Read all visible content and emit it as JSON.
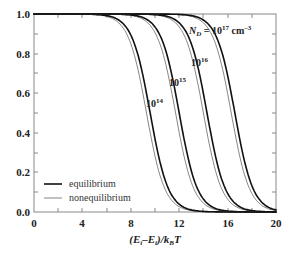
{
  "chart_data": {
    "type": "line",
    "title": "",
    "xlabel": "(E_t - E_i)/k_B T",
    "ylabel": "",
    "xlim": [
      0,
      20
    ],
    "ylim": [
      0.0,
      1.0
    ],
    "x_ticks": [
      "0",
      "4",
      "8",
      "12",
      "16",
      "20"
    ],
    "y_ticks": [
      "0.0",
      "0.2",
      "0.4",
      "0.6",
      "0.8",
      "1.0"
    ],
    "grid": false,
    "legend": {
      "position": "lower left",
      "entries": [
        {
          "label": "equilibrium",
          "style": "thick"
        },
        {
          "label": "nonequilibrium",
          "style": "thin"
        }
      ]
    },
    "annotations": [
      {
        "text": "N_D = 10^17 cm^-3",
        "applies_to": "10^17"
      },
      {
        "text": "10^16"
      },
      {
        "text": "10^15"
      },
      {
        "text": "10^14"
      }
    ],
    "series": [
      {
        "name": "equilibrium, N_D=1e14",
        "midpoint_x": 9.6,
        "width": 0.75
      },
      {
        "name": "nonequilibrium, N_D=1e14",
        "midpoint_x": 9.3,
        "width": 0.75
      },
      {
        "name": "equilibrium, N_D=1e15",
        "midpoint_x": 12.0,
        "width": 0.75
      },
      {
        "name": "nonequilibrium, N_D=1e15",
        "midpoint_x": 11.7,
        "width": 0.75
      },
      {
        "name": "equilibrium, N_D=1e16",
        "midpoint_x": 14.3,
        "width": 0.75
      },
      {
        "name": "nonequilibrium, N_D=1e16",
        "midpoint_x": 14.0,
        "width": 0.75
      },
      {
        "name": "equilibrium, N_D=1e17",
        "midpoint_x": 16.6,
        "width": 0.75
      },
      {
        "name": "nonequilibrium, N_D=1e17",
        "midpoint_x": 16.3,
        "width": 0.75
      }
    ],
    "sample_points": {
      "x": [
        0,
        4,
        6,
        8,
        9,
        10,
        11,
        12,
        13,
        14,
        15,
        16,
        17,
        18,
        19,
        20
      ],
      "equilibrium_1e14": [
        1.0,
        1.0,
        0.99,
        0.89,
        0.69,
        0.37,
        0.13,
        0.04,
        0.01,
        0.0,
        0.0,
        0.0,
        0.0,
        0.0,
        0.0,
        0.0
      ],
      "equilibrium_1e15": [
        1.0,
        1.0,
        1.0,
        1.0,
        0.99,
        0.96,
        0.8,
        0.5,
        0.21,
        0.06,
        0.02,
        0.0,
        0.0,
        0.0,
        0.0,
        0.0
      ],
      "equilibrium_1e16": [
        1.0,
        1.0,
        1.0,
        1.0,
        1.0,
        1.0,
        0.99,
        0.97,
        0.87,
        0.6,
        0.27,
        0.08,
        0.02,
        0.0,
        0.0,
        0.0
      ],
      "equilibrium_1e17": [
        1.0,
        1.0,
        1.0,
        1.0,
        1.0,
        1.0,
        1.0,
        1.0,
        0.99,
        0.97,
        0.89,
        0.68,
        0.33,
        0.1,
        0.03,
        0.01
      ]
    }
  },
  "labels": {
    "y_ticks": [
      "1.0",
      "0.8",
      "0.6",
      "0.4",
      "0.2",
      "0.0"
    ],
    "x_ticks": [
      "0",
      "4",
      "8",
      "12",
      "16",
      "20"
    ],
    "x_axis_title": "(E",
    "x_axis_title_full": "(Et–Ei)/kBT",
    "nd17_prefix": "N",
    "nd17_sub": "D",
    "nd17_mid": " = 10",
    "nd17_sup": "17",
    "nd17_unit": " cm",
    "nd17_unit_sup": "–3",
    "nd16_base": "10",
    "nd16_sup": "16",
    "nd15_base": "10",
    "nd15_sup": "15",
    "nd14_base": "10",
    "nd14_sup": "14",
    "legend_equilibrium": "equilibrium",
    "legend_nonequilibrium": "nonequilibrium"
  },
  "colors": {
    "axis": "#777777",
    "curve": "#1a1a1a",
    "thin_curve": "#555555",
    "text": "#222222"
  }
}
